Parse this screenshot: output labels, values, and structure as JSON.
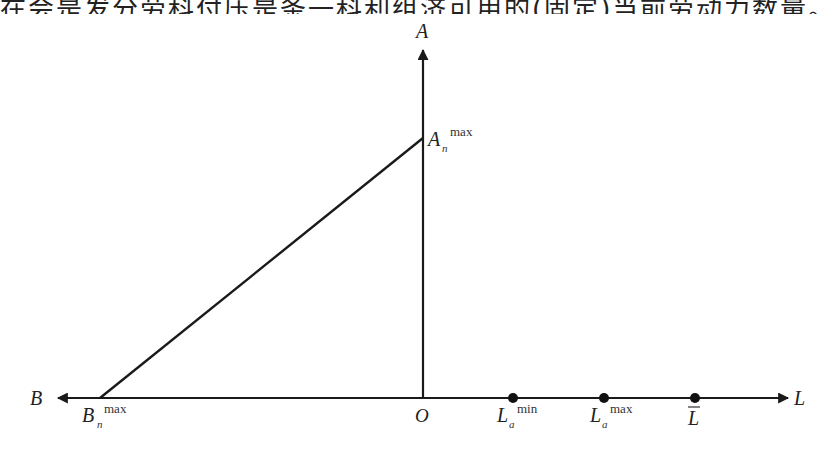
{
  "top_text": "在会是发分劳科付压是条一科利组济可用的(固定)当前劳动力数量。",
  "diagram": {
    "axes": {
      "vertical": {
        "label": "A"
      },
      "left": {
        "label": "B"
      },
      "right": {
        "label": "L"
      },
      "origin": {
        "label": "O"
      }
    },
    "points": {
      "a_max": {
        "base": "A",
        "sub": "n",
        "sup": "max"
      },
      "b_max": {
        "base": "B",
        "sub": "n",
        "sup": "max"
      },
      "la_min": {
        "base": "L",
        "sub": "a",
        "sup": "min"
      },
      "la_max": {
        "base": "L",
        "sub": "a",
        "sup": "max"
      },
      "l_bar": {
        "base": "L̄"
      }
    },
    "line_color": "#1a1a1a"
  }
}
